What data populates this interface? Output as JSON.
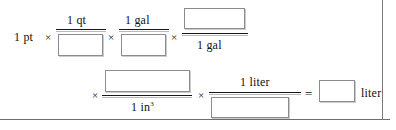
{
  "document": {
    "kind": "dimensional-analysis-worksheet",
    "border_color": "#6e6e6e",
    "text_color": "#111111",
    "box_border_color": "#8b8b90"
  },
  "equation": {
    "start_term": "1 pt",
    "operators": {
      "multiply": "×",
      "equals": "="
    },
    "row1": {
      "operator_1": "×",
      "fraction_1": {
        "numerator": "1 qt",
        "denominator": "",
        "denominator_is_blank": true
      },
      "operator_2": "×",
      "fraction_2": {
        "numerator": "1 gal",
        "denominator": "",
        "denominator_is_blank": true
      },
      "operator_3": "×",
      "fraction_3": {
        "numerator": "",
        "numerator_is_blank": true,
        "denominator": "1 gal"
      }
    },
    "row2": {
      "operator_1": "×",
      "fraction_4": {
        "numerator": "",
        "numerator_is_blank": true,
        "denominator": "1 in³",
        "denominator_base": "1 in",
        "denominator_exponent": "3"
      },
      "operator_2": "×",
      "fraction_5": {
        "numerator": "1 liter",
        "denominator": "",
        "denominator_is_blank": true
      },
      "equals": "=",
      "result": {
        "value": "",
        "value_is_blank": true,
        "unit": "liter"
      }
    }
  }
}
